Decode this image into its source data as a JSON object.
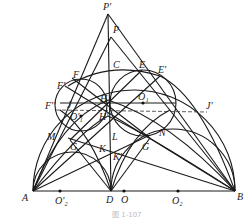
{
  "figure": {
    "caption": "图 1-107",
    "points": {
      "P_prime": "P'",
      "P": "P",
      "C": "C",
      "E": "E",
      "E_prime": "E'",
      "F": "F",
      "F_prime": "F'",
      "F_double": "F''",
      "J": "J",
      "J_prime": "J'",
      "H": "H",
      "H_prime": "H'",
      "O1": "O₁",
      "O1_prime": "O'₁",
      "M": "M",
      "N": "N",
      "G": "G",
      "G2": "G",
      "L": "L",
      "K": "K",
      "K_prime": "K'",
      "A": "A",
      "B": "B",
      "D": "D",
      "O": "O",
      "O2_prime": "O'₂",
      "O2": "O₂"
    }
  }
}
